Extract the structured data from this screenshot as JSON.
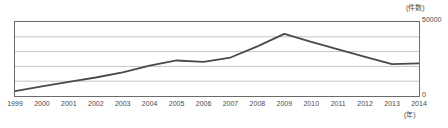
{
  "chart_data": {
    "type": "line",
    "title": "",
    "subtitle": "",
    "xlabel": "(年)",
    "ylabel": "(件数)",
    "categories": [
      "1999",
      "2000",
      "2001",
      "2002",
      "2003",
      "2004",
      "2005",
      "2006",
      "2007",
      "2008",
      "2009",
      "2010",
      "2011",
      "2012",
      "2013",
      "2014"
    ],
    "values": [
      3300,
      6500,
      9500,
      12500,
      16000,
      20500,
      24000,
      23000,
      26000,
      33500,
      42000,
      36500,
      31500,
      26500,
      21500,
      22000
    ],
    "series": [
      {
        "name": "件数",
        "values": [
          3300,
          6500,
          9500,
          12500,
          16000,
          20500,
          24000,
          23000,
          26000,
          33500,
          42000,
          36500,
          31500,
          26500,
          21500,
          22000
        ]
      }
    ],
    "ylim": [
      0,
      50000
    ],
    "y_ticks": [
      0,
      10000,
      20000,
      30000,
      40000,
      50000
    ],
    "y_axis_max_label": "50000",
    "y_axis_min_label": "0",
    "grid": true,
    "grid_orientation": "horizontal",
    "legend": false,
    "legend_position": "none",
    "line_color": "#4a4a4a",
    "grid_color": "#b5b5b5",
    "axis_color": "#6b6b6b",
    "background_color": "#ffffff",
    "annotations": []
  },
  "axes": {
    "y_unit": "(件数)",
    "y_max": "50000",
    "y_zero": "0",
    "x_unit": "(年)"
  }
}
